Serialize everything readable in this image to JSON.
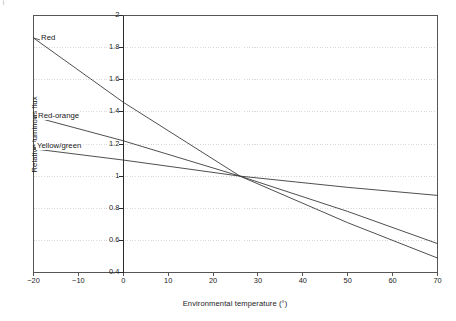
{
  "chart_data": {
    "type": "line",
    "title": "",
    "subtitle": "",
    "xlabel": "Environmental temperature (°)",
    "ylabel": "Relative luminous flux",
    "xlim": [
      -20,
      70
    ],
    "ylim": [
      0.4,
      2
    ],
    "x_ticks": [
      "-20",
      "-10",
      "0",
      "10",
      "20",
      "30",
      "40",
      "50",
      "60",
      "70"
    ],
    "x_tick_values": [
      -20,
      -10,
      0,
      10,
      20,
      30,
      40,
      50,
      60,
      70
    ],
    "y_ticks": [
      "0.4",
      "0.6",
      "0.8",
      "1",
      "1.2",
      "1.4",
      "1.6",
      "1.8",
      "2"
    ],
    "y_tick_values": [
      0.4,
      0.6,
      0.8,
      1.0,
      1.2,
      1.4,
      1.6,
      1.8,
      2.0
    ],
    "grid": "horizontal-dotted",
    "legend_position": "inline-annotations",
    "line_color": "#3b3b3b",
    "grid_color": "#c8c8c8",
    "axis_color": "#555555",
    "series": [
      {
        "name": "Red",
        "label": "Red",
        "x": [
          -20,
          0,
          26,
          50,
          70
        ],
        "values": [
          1.86,
          1.46,
          1.0,
          0.71,
          0.49
        ]
      },
      {
        "name": "Red-orange",
        "label": "Red-orange",
        "x": [
          -20,
          0,
          26,
          50,
          70
        ],
        "values": [
          1.37,
          1.22,
          1.0,
          0.78,
          0.58
        ]
      },
      {
        "name": "Yellow/green",
        "label": "Yellow/green",
        "x": [
          -20,
          0,
          26,
          50,
          70
        ],
        "values": [
          1.17,
          1.1,
          1.0,
          0.93,
          0.88
        ]
      }
    ],
    "annotations": [
      {
        "text": "Red",
        "x_px": 40,
        "y_px": 33
      },
      {
        "text": "Red-orange",
        "x_px": 37,
        "y_px": 111
      },
      {
        "text": "Yellow/green",
        "x_px": 36,
        "y_px": 141
      }
    ]
  },
  "corner": {
    "mark": "⌇"
  }
}
